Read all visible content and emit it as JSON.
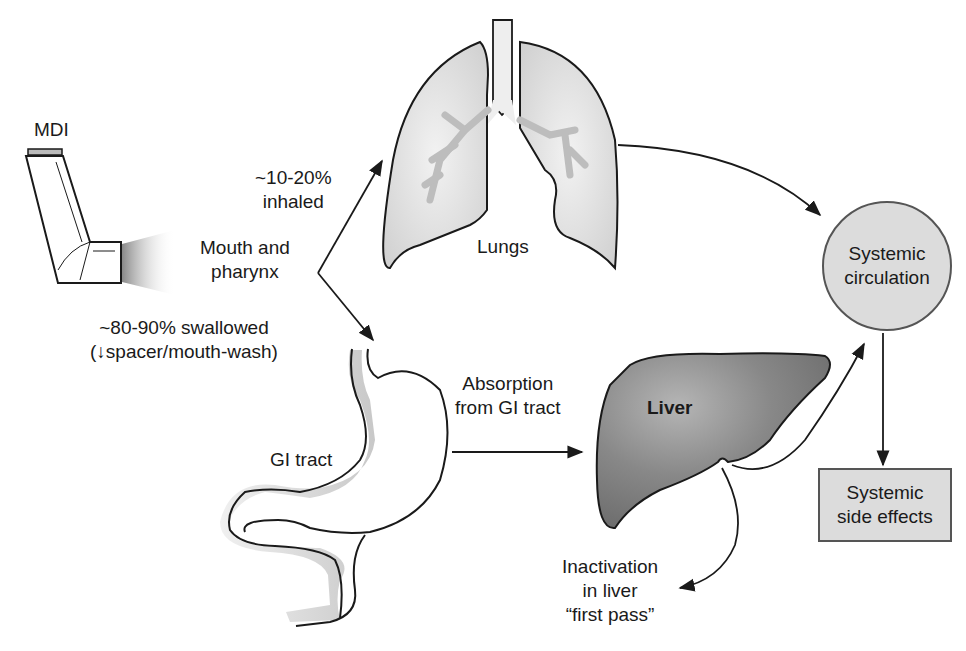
{
  "diagram": {
    "type": "flow",
    "devices": {
      "mdi": {
        "label": "MDI"
      }
    },
    "organs": {
      "mouth": {
        "label_line1": "Mouth and",
        "label_line2": "pharynx"
      },
      "lungs": {
        "label": "Lungs"
      },
      "gi_tract": {
        "label": "GI tract"
      },
      "liver": {
        "label": "Liver"
      }
    },
    "nodes": {
      "systemic_circulation": {
        "line1": "Systemic",
        "line2": "circulation"
      },
      "systemic_side_effects": {
        "line1": "Systemic",
        "line2": "side effects"
      }
    },
    "edges": {
      "inhaled": {
        "line1": "~10-20%",
        "line2": "inhaled",
        "from": "mouth",
        "to": "lungs"
      },
      "swallowed": {
        "line1": "~80-90% swallowed",
        "line2": "(↓spacer/mouth-wash)",
        "from": "mouth",
        "to": "gi_tract"
      },
      "absorption": {
        "line1": "Absorption",
        "line2": "from GI tract",
        "from": "gi_tract",
        "to": "liver"
      },
      "first_pass": {
        "line1": "Inactivation",
        "line2": "in liver",
        "line3": "“first pass”",
        "from": "liver",
        "to": "inactivation"
      },
      "lungs_to_circulation": {
        "from": "lungs",
        "to": "systemic_circulation"
      },
      "liver_to_circulation": {
        "from": "liver",
        "to": "systemic_circulation"
      },
      "circulation_to_effects": {
        "from": "systemic_circulation",
        "to": "systemic_side_effects"
      }
    },
    "colors": {
      "organ_fill": "#dedede",
      "liver_fill": "#7a7a7a",
      "node_fill": "#dcdcdc",
      "stroke": "#1a1a1a"
    }
  }
}
